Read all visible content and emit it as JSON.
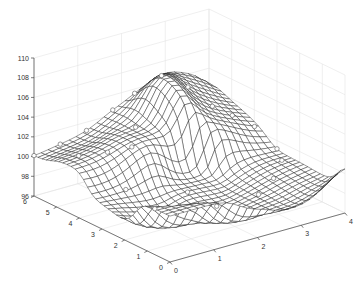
{
  "chart_data": {
    "type": "surface",
    "title": "",
    "xlabel": "",
    "ylabel": "",
    "zlabel": "",
    "x_ticks": [
      "0",
      "1",
      "2",
      "3",
      "4"
    ],
    "y_ticks": [
      "0",
      "1",
      "2",
      "3",
      "4",
      "5",
      "6"
    ],
    "z_ticks": [
      "96",
      "98",
      "100",
      "102",
      "104",
      "106",
      "108",
      "110"
    ],
    "xlim": [
      0,
      4
    ],
    "ylim": [
      0,
      6
    ],
    "zlim": [
      96,
      110
    ],
    "grid": true,
    "mesh_resolution": [
      25,
      33
    ],
    "scatter_points": [
      {
        "x": 0.0,
        "y": 6.0,
        "z": 100.0
      },
      {
        "x": 0.6,
        "y": 6.0,
        "z": 100.5
      },
      {
        "x": 1.2,
        "y": 6.0,
        "z": 101.0
      },
      {
        "x": 1.8,
        "y": 6.0,
        "z": 102.5
      },
      {
        "x": 2.3,
        "y": 6.0,
        "z": 103.0
      },
      {
        "x": 2.5,
        "y": 5.2,
        "z": 107.5
      },
      {
        "x": 3.0,
        "y": 5.0,
        "z": 104.5
      },
      {
        "x": 3.3,
        "y": 4.5,
        "z": 102.5
      },
      {
        "x": 3.6,
        "y": 4.2,
        "z": 101.8
      },
      {
        "x": 3.9,
        "y": 3.8,
        "z": 100.5
      },
      {
        "x": 4.0,
        "y": 3.0,
        "z": 98.8
      },
      {
        "x": 0.4,
        "y": 4.8,
        "z": 100.8
      },
      {
        "x": 0.8,
        "y": 4.3,
        "z": 101.5
      },
      {
        "x": 1.2,
        "y": 4.0,
        "z": 102.3
      },
      {
        "x": 1.7,
        "y": 4.8,
        "z": 102.0
      },
      {
        "x": 0.7,
        "y": 3.3,
        "z": 98.5
      },
      {
        "x": 1.0,
        "y": 2.6,
        "z": 96.8
      },
      {
        "x": 1.8,
        "y": 2.7,
        "z": 98.0
      },
      {
        "x": 2.0,
        "y": 1.8,
        "z": 97.0
      },
      {
        "x": 2.8,
        "y": 1.5,
        "z": 97.5
      },
      {
        "x": 3.3,
        "y": 1.8,
        "z": 98.5
      },
      {
        "x": 3.8,
        "y": 2.4,
        "z": 99.0
      }
    ],
    "peak": {
      "x": 2.5,
      "y": 5.2,
      "z": 107.5
    }
  },
  "axes": {
    "z_tick_labels": [
      "96",
      "98",
      "100",
      "102",
      "104",
      "106",
      "108",
      "110"
    ],
    "y_tick_labels": [
      "0",
      "1",
      "2",
      "3",
      "4",
      "5",
      "6"
    ],
    "x_tick_labels": [
      "0",
      "1",
      "2",
      "3",
      "4"
    ]
  }
}
